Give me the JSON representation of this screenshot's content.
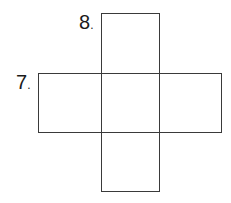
{
  "puzzle": {
    "type": "crossword-fragment",
    "clues": [
      {
        "number": "8",
        "suffix": ".",
        "direction": "down",
        "cells": 3
      },
      {
        "number": "7",
        "suffix": ".",
        "direction": "across",
        "cells": 3
      }
    ],
    "line_color": "#3a3a3a",
    "background": "#ffffff"
  }
}
